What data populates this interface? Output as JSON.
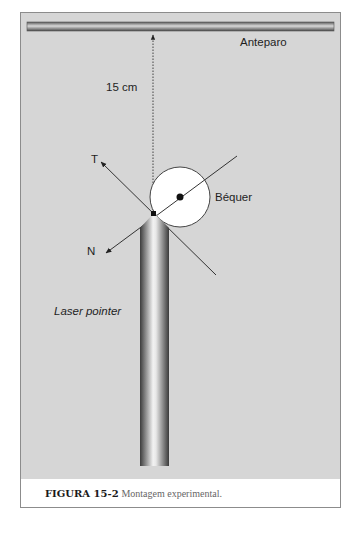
{
  "figure": {
    "labels": {
      "screen": "Anteparo",
      "distance": "15 cm",
      "tangent": "T",
      "normal": "N",
      "beaker": "Béquer",
      "laser": "Laser pointer"
    },
    "caption": {
      "number": "FIGURA 15-2",
      "text": "Montagem experimental."
    },
    "colors": {
      "background_panel": "#d6d6d6",
      "frame_border": "#8c8c8c",
      "line": "#3a3a3a",
      "beaker_fill": "#ffffff"
    }
  }
}
